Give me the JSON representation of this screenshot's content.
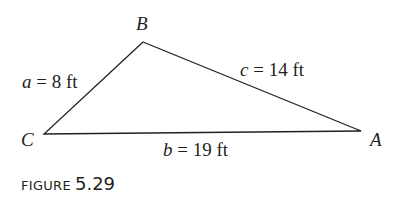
{
  "figure": {
    "vertices": {
      "A": {
        "label": "A",
        "x": 361,
        "y": 131
      },
      "B": {
        "label": "B",
        "x": 143,
        "y": 42
      },
      "C": {
        "label": "C",
        "x": 44,
        "y": 134
      }
    },
    "sides": {
      "a": {
        "var": "a",
        "eq": " = 8 ft"
      },
      "b": {
        "var": "b",
        "eq": " = 19 ft"
      },
      "c": {
        "var": "c",
        "eq": " = 14 ft"
      }
    },
    "line_color": "#231f20"
  },
  "caption": {
    "word": "FIGURE",
    "number": "5.29"
  }
}
